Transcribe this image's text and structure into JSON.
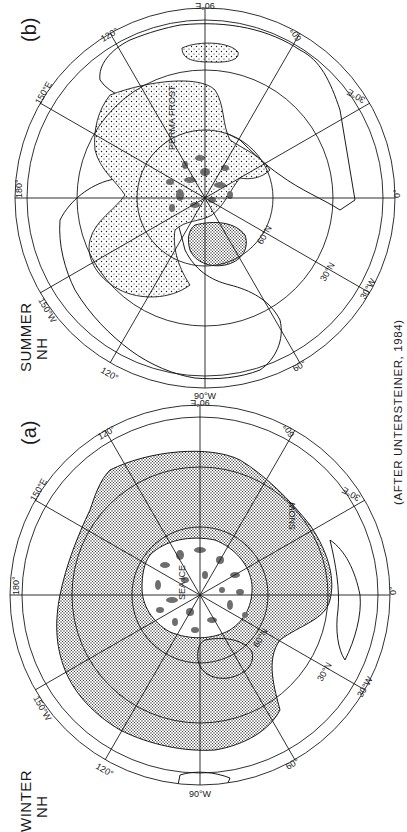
{
  "figure": {
    "credit": "(AFTER UNTERSTEINER, 1984)",
    "panels": [
      {
        "id": "b",
        "tag": "(b)",
        "season": "SUMMER",
        "hemisphere": "NH",
        "region_labels": {
          "permafrost": "PERMA FROST"
        },
        "latitude_labels": {
          "lat30": "30°N",
          "lat60": "60°N"
        },
        "longitude_labels": {
          "lon0": "0°",
          "lon30e": "30°E",
          "lon60": "60°",
          "lon90e": "90°E",
          "lon120": "120°",
          "lon150e": "150°E",
          "lon180": "180°",
          "lon150w": "150°W",
          "lon120w": "120°",
          "lon90w": "90°W",
          "lon60w": "60°",
          "lon30w": "30°W"
        }
      },
      {
        "id": "a",
        "tag": "(a)",
        "season": "WINTER",
        "hemisphere": "NH",
        "region_labels": {
          "sea_ice": "SEA ICE",
          "snow": "SNOW"
        },
        "latitude_labels": {
          "lat30": "30°N",
          "lat60": "60°N"
        },
        "longitude_labels": {
          "lon0": "0°",
          "lon30e": "30°E",
          "lon60": "60°",
          "lon90e": "90°E",
          "lon120": "120°",
          "lon150e": "150°E",
          "lon180": "180°",
          "lon150w": "150°W",
          "lon120w": "120°",
          "lon90w": "90°W",
          "lon60w": "60°",
          "lon30w": "30°W"
        }
      }
    ]
  },
  "colors": {
    "ink": "#1a1a1a",
    "ice_patch": "#6e6e6e",
    "background": "#ffffff"
  }
}
